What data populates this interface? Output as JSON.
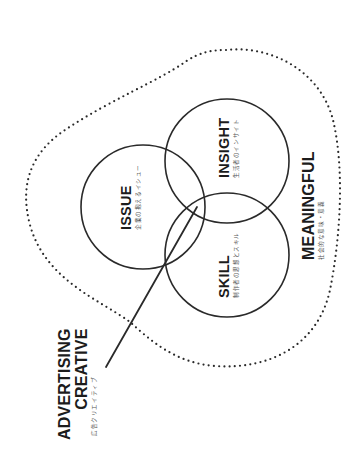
{
  "diagram": {
    "circles": [
      {
        "id": "issue",
        "title": "ISSUE",
        "subtitle": "企業の抱えるイシュー"
      },
      {
        "id": "insight",
        "title": "INSIGHT",
        "subtitle": "生活者のインサイト"
      },
      {
        "id": "skill",
        "title": "SKILL",
        "subtitle": "制作者の思想とスキル"
      }
    ],
    "outer_region": {
      "title": "MEANINGFUL",
      "subtitle": "社会的な意味・意義"
    },
    "pointer_label": {
      "line1": "ADVERTISING",
      "line2": "CREATIVE",
      "subtitle": "広告クリエイティブ"
    },
    "colors": {
      "stroke": "#2a2a2a",
      "dots": "#2a2a2a",
      "background": "#ffffff"
    }
  }
}
